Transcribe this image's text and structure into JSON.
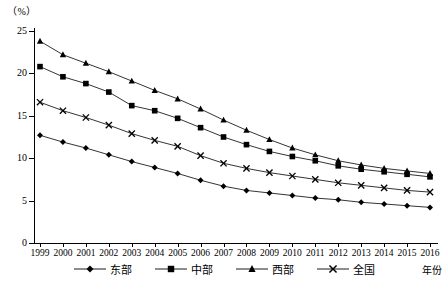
{
  "chart_data": {
    "type": "line",
    "title": "",
    "subtitle": "",
    "unit_label": "（%）",
    "xlabel": "年份",
    "ylabel": "",
    "grid": false,
    "legend_position": "bottom",
    "ylim": [
      0,
      25
    ],
    "yticks": [
      0,
      5,
      10,
      15,
      20,
      25
    ],
    "ytick_labels": [
      "0",
      "5",
      "10",
      "15",
      "20",
      "25"
    ],
    "categories": [
      "1999",
      "2000",
      "2001",
      "2002",
      "2003",
      "2004",
      "2005",
      "2006",
      "2007",
      "2008",
      "2009",
      "2010",
      "2011",
      "2012",
      "2013",
      "2014",
      "2015",
      "2016"
    ],
    "series": [
      {
        "name": "东部",
        "marker": "diamond",
        "values": [
          12.7,
          11.9,
          11.2,
          10.4,
          9.6,
          8.9,
          8.2,
          7.4,
          6.7,
          6.2,
          5.9,
          5.6,
          5.3,
          5.1,
          4.8,
          4.6,
          4.4,
          4.2
        ]
      },
      {
        "name": "中部",
        "marker": "square",
        "values": [
          20.8,
          19.6,
          18.8,
          17.8,
          16.2,
          15.6,
          14.7,
          13.6,
          12.5,
          11.6,
          10.8,
          10.2,
          9.7,
          9.1,
          8.7,
          8.4,
          8.1,
          7.8
        ]
      },
      {
        "name": "西部",
        "marker": "triangle",
        "values": [
          23.8,
          22.2,
          21.2,
          20.2,
          19.1,
          18.0,
          17.0,
          15.8,
          14.5,
          13.3,
          12.2,
          11.2,
          10.4,
          9.7,
          9.2,
          8.8,
          8.5,
          8.2
        ]
      },
      {
        "name": "全国",
        "marker": "cross",
        "values": [
          16.6,
          15.6,
          14.8,
          13.9,
          12.9,
          12.1,
          11.4,
          10.3,
          9.4,
          8.8,
          8.3,
          7.9,
          7.5,
          7.1,
          6.8,
          6.5,
          6.2,
          6.0
        ]
      }
    ]
  },
  "legend": {
    "items": [
      {
        "label": "东部",
        "marker": "diamond"
      },
      {
        "label": "中部",
        "marker": "square"
      },
      {
        "label": "西部",
        "marker": "triangle"
      },
      {
        "label": "全国",
        "marker": "cross"
      }
    ]
  }
}
